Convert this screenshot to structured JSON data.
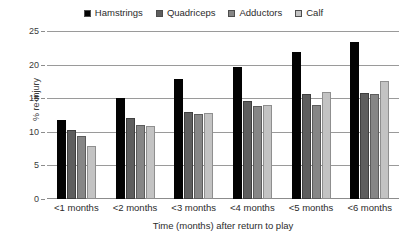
{
  "chart_data": {
    "type": "bar",
    "title": "",
    "subtitle": "",
    "xlabel": "Time (months) after return to play",
    "ylabel": "% re-injury",
    "categories": [
      "<1 months",
      "<2 months",
      "<3 months",
      "<4 months",
      "<5 months",
      "<6 months"
    ],
    "series": [
      {
        "name": "Hamstrings",
        "color": "#030303",
        "values": [
          11.8,
          15.0,
          17.9,
          19.6,
          21.9,
          23.4
        ]
      },
      {
        "name": "Quadriceps",
        "color": "#5e5e5e",
        "values": [
          10.2,
          12.1,
          13.0,
          14.6,
          15.6,
          15.8
        ]
      },
      {
        "name": "Adductors",
        "color": "#868686",
        "values": [
          9.4,
          11.0,
          12.6,
          13.8,
          14.0,
          15.6
        ]
      },
      {
        "name": "Calf",
        "color": "#c3c3c3",
        "values": [
          7.9,
          10.9,
          12.8,
          14.0,
          15.9,
          17.6
        ]
      }
    ],
    "ylim": [
      0,
      25
    ],
    "yticks": [
      0,
      5,
      10,
      15,
      20,
      25
    ],
    "ytick_labels": [
      "0",
      "5",
      "10",
      "15",
      "20",
      "25"
    ],
    "grid": true,
    "legend_position": "top-center"
  }
}
